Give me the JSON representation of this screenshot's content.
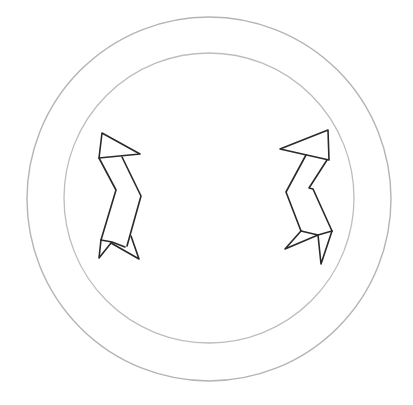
{
  "drawing": {
    "subject": "two zigzag figures inside a double circle",
    "colors": {
      "background": "#ffffff",
      "ring_outer": "#b4b4b4",
      "ring_inner": "#bdbdbd",
      "figure_stroke": "#2a2a2a"
    },
    "rings": {
      "outer": {
        "cx": 209,
        "cy": 199,
        "r": 182
      },
      "inner": {
        "cx": 209,
        "cy": 198,
        "r": 145
      }
    },
    "figures": [
      {
        "name": "left-figure",
        "position": "left"
      },
      {
        "name": "right-figure",
        "position": "right"
      }
    ]
  }
}
